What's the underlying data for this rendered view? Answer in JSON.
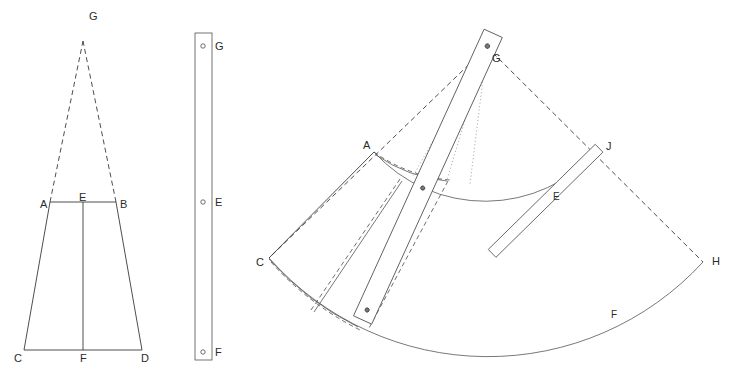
{
  "figure": {
    "background_color": "#ffffff",
    "line_color": "#3a3a3a",
    "accent_dotted_color": "#8b8b8b"
  },
  "panels": [
    {
      "id": "elevation",
      "name": "trapezoid-elevation",
      "labels": [
        {
          "key": "G",
          "text": "G",
          "x": 89,
          "y": 20
        },
        {
          "key": "A",
          "text": "A",
          "x": 40,
          "y": 208
        },
        {
          "key": "E",
          "text": "E",
          "x": 79,
          "y": 201
        },
        {
          "key": "B",
          "text": "B",
          "x": 120,
          "y": 208
        },
        {
          "key": "C",
          "text": "C",
          "x": 14,
          "y": 362
        },
        {
          "key": "F",
          "text": "F",
          "x": 80,
          "y": 362
        },
        {
          "key": "D",
          "text": "D",
          "x": 141,
          "y": 362
        }
      ],
      "points": {
        "G": [
          83,
          41
        ],
        "A": [
          50,
          202
        ],
        "B": [
          116,
          202
        ],
        "E": [
          83,
          202
        ],
        "C": [
          24,
          350
        ],
        "D": [
          142,
          350
        ],
        "F": [
          83,
          350
        ]
      }
    },
    {
      "id": "batten",
      "name": "straight-batten-strip",
      "labels": [
        {
          "key": "G",
          "text": "G",
          "x": 215,
          "y": 50
        },
        {
          "key": "E",
          "text": "E",
          "x": 215,
          "y": 206
        },
        {
          "key": "F",
          "text": "F",
          "x": 215,
          "y": 356
        },
        {
          "key": "strip",
          "text": ""
        }
      ],
      "holes": [
        {
          "key": "G",
          "cx": 203,
          "cy": 46,
          "r": 2.2
        },
        {
          "key": "E",
          "cx": 203,
          "cy": 202,
          "r": 2.2
        },
        {
          "key": "F",
          "cx": 203,
          "cy": 352,
          "r": 2.2
        }
      ],
      "strip_rect": {
        "x": 195,
        "y": 33,
        "width": 17,
        "height": 327
      }
    },
    {
      "id": "fan",
      "name": "developed-cone-fan",
      "labels": [
        {
          "key": "G",
          "text": "G",
          "x": 492,
          "y": 62
        },
        {
          "key": "A",
          "text": "A",
          "x": 363,
          "y": 149
        },
        {
          "key": "E",
          "text": "E",
          "x": 553,
          "y": 200
        },
        {
          "key": "J",
          "text": "J",
          "x": 606,
          "y": 150
        },
        {
          "key": "C",
          "text": "C",
          "x": 256,
          "y": 266
        },
        {
          "key": "H",
          "text": "H",
          "x": 712,
          "y": 265
        },
        {
          "key": "F",
          "text": "F",
          "x": 611,
          "y": 318
        }
      ],
      "points": {
        "G": [
          487,
          47
        ],
        "A": [
          374,
          152
        ],
        "C": [
          269,
          258
        ],
        "J": [
          598,
          150
        ],
        "H": [
          703,
          262
        ],
        "E_hole": [
          547,
          190
        ],
        "F_hole": [
          608,
          323
        ]
      },
      "radii": {
        "inner_arc": 150,
        "outer_arc": 292
      },
      "holes": [
        {
          "key": "G",
          "cx": 487,
          "cy": 47,
          "r": 2.3
        },
        {
          "key": "E",
          "cx": 547,
          "cy": 190,
          "r": 2.1
        },
        {
          "key": "F",
          "cx": 608,
          "cy": 323,
          "r": 2.1
        }
      ]
    }
  ],
  "legend_points": [
    "A",
    "B",
    "C",
    "D",
    "E",
    "F",
    "G",
    "H",
    "J"
  ]
}
